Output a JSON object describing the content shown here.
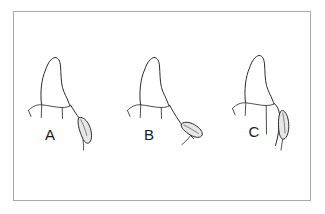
{
  "figure": {
    "type": "line-drawing",
    "background_color": "#ffffff",
    "frame": {
      "present": true,
      "color": "#a9a9a9",
      "x": 13,
      "y": 11,
      "width": 298,
      "height": 190
    },
    "ink_color": "#2b2b2b",
    "blade_fill_color": "#e6e6e6",
    "panels": [
      {
        "id": "panel-a",
        "label": "A",
        "label_x": 50,
        "label_y": 140,
        "instrument_angulation": "blade tilted, tip toward tooth, shank curving up-right",
        "tooth": "single pointed-cusp crown with gingival margin line and papilla ticks"
      },
      {
        "id": "panel-b",
        "label": "B",
        "label_x": 149,
        "label_y": 140,
        "instrument_angulation": "blade laid more horizontally, open angle away from tooth",
        "tooth": "single pointed-cusp crown with gingival margin line and papilla ticks"
      },
      {
        "id": "panel-c",
        "label": "C",
        "label_x": 254,
        "label_y": 137,
        "instrument_angulation": "blade held near vertical, closely adapted along root surface",
        "tooth": "single pointed-cusp crown with gingival margin line and papilla ticks"
      }
    ]
  }
}
